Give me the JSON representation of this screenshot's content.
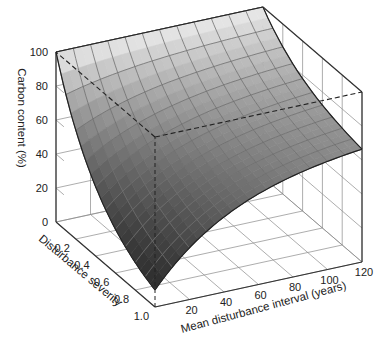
{
  "chart_data": {
    "type": "surface3d",
    "title": "",
    "xlabel": "Mean disturbance interval (years)",
    "ylabel": "Disturbance severity",
    "zlabel": "Carbon content (%)",
    "x_ticks": [
      20,
      40,
      60,
      80,
      100,
      120
    ],
    "y_ticks": [
      0.2,
      0.4,
      0.6,
      0.8,
      1.0
    ],
    "z_ticks": [
      0,
      20,
      40,
      60,
      80,
      100
    ],
    "xlim": [
      0,
      120
    ],
    "ylim": [
      0,
      1.0
    ],
    "zlim": [
      0,
      100
    ],
    "grid": true,
    "surface_description": "Carbon content = 100% at severity 0 for all intervals; decreases with severity and increases with interval. Minimum ~10% at severity 1.0 and shortest interval; ~70% at severity 1.0 and interval 120.",
    "edge_samples": {
      "severity_1_vs_interval": {
        "x": [
          0,
          20,
          40,
          60,
          80,
          100,
          120
        ],
        "z": [
          10,
          33,
          47,
          56,
          62,
          67,
          70
        ]
      },
      "interval_0_vs_severity": {
        "y": [
          0,
          0.2,
          0.4,
          0.6,
          0.8,
          1.0
        ],
        "z": [
          100,
          70,
          48,
          32,
          19,
          10
        ]
      },
      "severity_0_vs_interval": {
        "x": [
          0,
          120
        ],
        "z": [
          100,
          100
        ]
      }
    },
    "annotations": [
      "dashed guide lines from front corner (interval 0, severity 1.0) vertically and to back walls at z=100"
    ]
  },
  "labels": {
    "z_axis": "Carbon content (%)",
    "y_axis": "Disturbance severity",
    "x_axis": "Mean disturbance interval (years)",
    "z_ticks": [
      "0",
      "20",
      "40",
      "60",
      "80",
      "100"
    ],
    "y_ticks": [
      "0.2",
      "0.4",
      "0.6",
      "0.8",
      "1.0"
    ],
    "x_ticks": [
      "20",
      "40",
      "60",
      "80",
      "100",
      "120"
    ]
  },
  "colors": {
    "surface_light": "#e6e6e6",
    "surface_dark": "#333333",
    "grid": "#777777",
    "axes": "#333333"
  }
}
